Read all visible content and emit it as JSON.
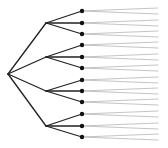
{
  "diagram": {
    "type": "tree",
    "orientation": "left-to-right",
    "colors": {
      "background": "#ffffff",
      "edge": "#222222",
      "node": "#111111",
      "terminal_edge": "#aaaaaa"
    },
    "root": {
      "x": 8,
      "y": 74
    },
    "branches": [
      {
        "x": 46,
        "y": 23,
        "leaves": [
          11,
          23,
          34
        ]
      },
      {
        "x": 46,
        "y": 57,
        "leaves": [
          45,
          57,
          68
        ]
      },
      {
        "x": 46,
        "y": 91,
        "leaves": [
          80,
          91,
          102
        ]
      },
      {
        "x": 46,
        "y": 126,
        "leaves": [
          114,
          126,
          137
        ]
      }
    ],
    "leaf_x": 82,
    "leaf_radius": 2.2,
    "terminal": {
      "end_x": 158,
      "spread": 3
    }
  }
}
